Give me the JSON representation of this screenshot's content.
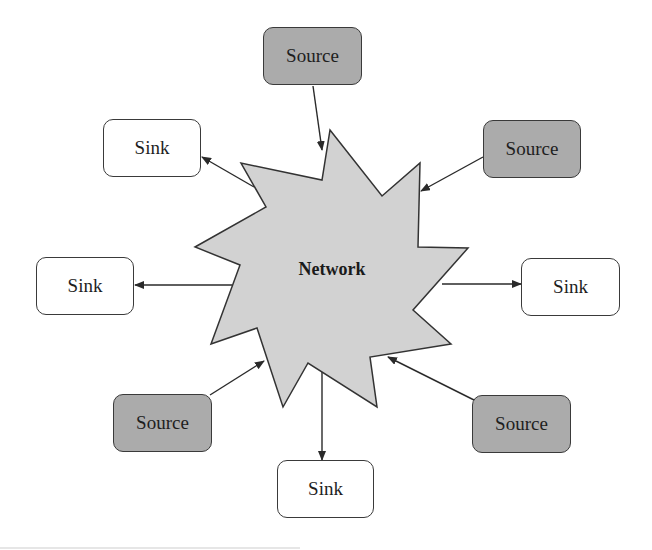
{
  "diagram": {
    "title": "",
    "hub": {
      "label": "Network",
      "shape": "starburst",
      "fill": "#d2d2d2",
      "stroke": "#333333",
      "points": "330,130 382,196 420,163 418,247 468,248 413,310 451,344 370,357 377,407 308,363 283,407 257,328 211,344 240,265 195,247 266,207 241,163 322,180"
    },
    "colors": {
      "source_fill": "#ababab",
      "sink_fill": "#ffffff",
      "stroke": "#333333",
      "arrow": "#2a2a2a"
    },
    "nodes": [
      {
        "id": "source-top",
        "type": "source",
        "label": "Source",
        "x": 263,
        "y": 27,
        "w": 99,
        "h": 58
      },
      {
        "id": "source-upper-right",
        "type": "source",
        "label": "Source",
        "x": 483,
        "y": 120,
        "w": 98,
        "h": 58
      },
      {
        "id": "source-lower-left",
        "type": "source",
        "label": "Source",
        "x": 113,
        "y": 394,
        "w": 99,
        "h": 58
      },
      {
        "id": "source-lower-right",
        "type": "source",
        "label": "Source",
        "x": 472,
        "y": 395,
        "w": 99,
        "h": 58
      },
      {
        "id": "sink-upper-left",
        "type": "sink",
        "label": "Sink",
        "x": 103,
        "y": 119,
        "w": 98,
        "h": 58
      },
      {
        "id": "sink-left",
        "type": "sink",
        "label": "Sink",
        "x": 36,
        "y": 257,
        "w": 98,
        "h": 58
      },
      {
        "id": "sink-right",
        "type": "sink",
        "label": "Sink",
        "x": 521,
        "y": 258,
        "w": 99,
        "h": 58
      },
      {
        "id": "sink-bottom",
        "type": "sink",
        "label": "Sink",
        "x": 277,
        "y": 460,
        "w": 97,
        "h": 58
      }
    ],
    "edges": [
      {
        "from": "source-top",
        "to": "network",
        "x1": 313,
        "y1": 86,
        "x2": 322,
        "y2": 150
      },
      {
        "from": "source-upper-right",
        "to": "network",
        "x1": 483,
        "y1": 157,
        "x2": 421,
        "y2": 191
      },
      {
        "from": "source-lower-left",
        "to": "network",
        "x1": 210,
        "y1": 395,
        "x2": 264,
        "y2": 361
      },
      {
        "from": "source-lower-right",
        "to": "network",
        "x1": 474,
        "y1": 400,
        "x2": 388,
        "y2": 357
      },
      {
        "from": "network",
        "to": "sink-upper-left",
        "x1": 254,
        "y1": 187,
        "x2": 202,
        "y2": 157
      },
      {
        "from": "network",
        "to": "sink-left",
        "x1": 232,
        "y1": 285,
        "x2": 135,
        "y2": 285
      },
      {
        "from": "network",
        "to": "sink-right",
        "x1": 442,
        "y1": 284,
        "x2": 521,
        "y2": 284
      },
      {
        "from": "network",
        "to": "sink-bottom",
        "x1": 322,
        "y1": 366,
        "x2": 322,
        "y2": 460
      }
    ]
  }
}
